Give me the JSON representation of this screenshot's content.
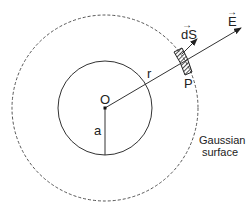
{
  "diagram": {
    "title": "",
    "labels": {
      "center": "O",
      "radius_inner": "a",
      "radius_r": "r",
      "point": "P",
      "area_vector": "dS",
      "field_vector": "E",
      "surface": "Gaussian surface",
      "surface_line1": "Gaussian",
      "surface_line2": "surface"
    },
    "shapes": {
      "inner_sphere": {
        "cx": 105,
        "cy": 108,
        "r": 47,
        "style": "solid"
      },
      "gaussian_surface": {
        "cx": 105,
        "cy": 108,
        "r": 93,
        "style": "dashed"
      }
    },
    "colors": {
      "stroke": "#333333",
      "background": "#ffffff"
    }
  }
}
